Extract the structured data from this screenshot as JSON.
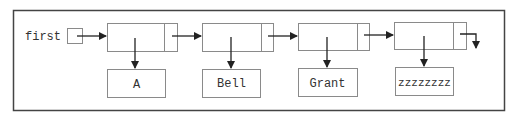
{
  "diagram": {
    "type": "linked-list",
    "head_label": "first",
    "nodes": [
      {
        "value": "A"
      },
      {
        "value": "Bell"
      },
      {
        "value": "Grant"
      },
      {
        "value": "zzzzzzzz"
      }
    ],
    "terminator": "null",
    "colors": {
      "frame": "#444444",
      "box": "#8a8a8a",
      "arrow": "#222222",
      "text": "#333333",
      "background": "#ffffff"
    }
  }
}
